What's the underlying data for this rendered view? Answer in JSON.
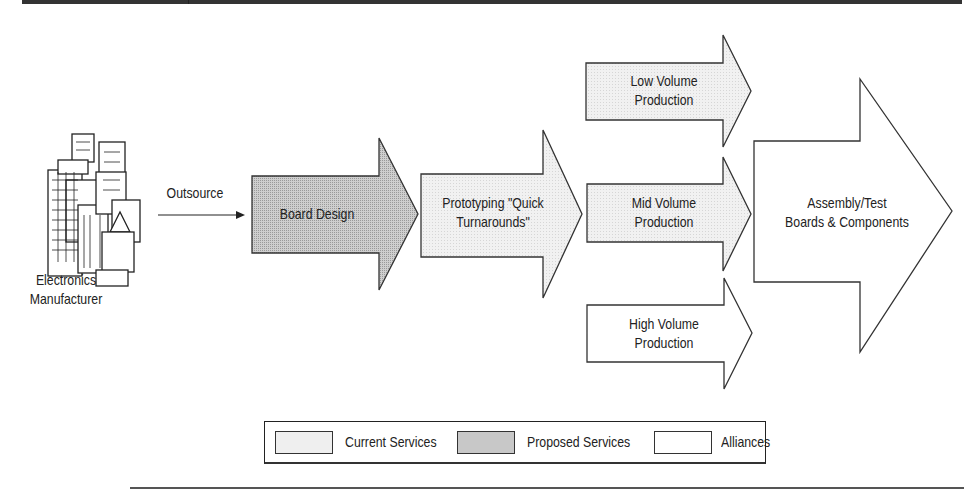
{
  "diagram": {
    "source": {
      "icon": "office-buildings-icon",
      "label_line1": "Electronics",
      "label_line2": "Manufacturer"
    },
    "connector": {
      "label": "Outsource"
    },
    "arrows": [
      {
        "id": "board-design",
        "line1": "Board Design",
        "line2": "",
        "category": "Proposed Services"
      },
      {
        "id": "prototyping",
        "line1": "Prototyping \"Quick",
        "line2": "Turnarounds\"",
        "category": "Current Services"
      },
      {
        "id": "low-volume",
        "line1": "Low Volume",
        "line2": "Production",
        "category": "Current Services"
      },
      {
        "id": "mid-volume",
        "line1": "Mid Volume",
        "line2": "Production",
        "category": "Current Services"
      },
      {
        "id": "high-volume",
        "line1": "High Volume",
        "line2": "Production",
        "category": "Alliances"
      },
      {
        "id": "assembly-test",
        "line1": "Assembly/Test",
        "line2": "Boards & Components",
        "category": "Alliances"
      }
    ],
    "legend": [
      {
        "label": "Current Services",
        "color": "#ededed"
      },
      {
        "label": "Proposed Services",
        "color": "#c4c4c4"
      },
      {
        "label": "Alliances",
        "color": "#ffffff"
      }
    ]
  },
  "colors": {
    "current": "#ededed",
    "proposed": "#c4c4c4",
    "alliance": "#ffffff",
    "stroke": "#333333"
  }
}
